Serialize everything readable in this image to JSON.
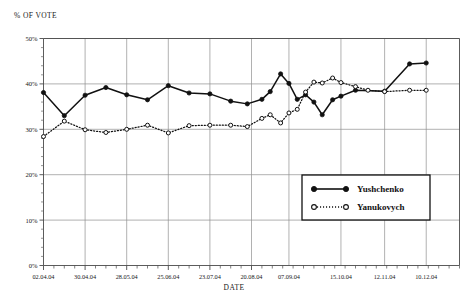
{
  "chart_data": {
    "type": "line",
    "title": "",
    "ylabel": "% OF VOTE",
    "xlabel": "DATE",
    "ylim": [
      0,
      50
    ],
    "ytick_labels": [
      "0%",
      "10%",
      "20%",
      "30%",
      "40%",
      "50%"
    ],
    "ytick_values": [
      0,
      10,
      20,
      30,
      40,
      50
    ],
    "yminor_step": 2,
    "grid": true,
    "legend_position": "inside-right",
    "xtick_labels": [
      "02.04.04",
      "30.04.04",
      "28.05.04",
      "25.06.04",
      "23.07.04",
      "20.08.04",
      "07.09.04",
      "15.10.04",
      "12.11.04",
      "10.12.04"
    ],
    "xtick_positions": [
      0,
      4,
      8,
      12,
      16,
      20,
      23.6,
      28.6,
      32.8,
      36.8
    ],
    "x_minor_count": 40,
    "series": [
      {
        "name": "Yushchenko",
        "marker": "filled-circle",
        "line": "solid",
        "color": "#111111",
        "points": [
          [
            0,
            38.1
          ],
          [
            2.0,
            33.0
          ],
          [
            4.0,
            37.5
          ],
          [
            6.0,
            39.2
          ],
          [
            8.0,
            37.6
          ],
          [
            10.0,
            36.5
          ],
          [
            12.0,
            39.6
          ],
          [
            14.0,
            38.0
          ],
          [
            16.0,
            37.8
          ],
          [
            18.0,
            36.2
          ],
          [
            19.6,
            35.6
          ],
          [
            21.0,
            36.6
          ],
          [
            21.8,
            38.3
          ],
          [
            22.8,
            42.2
          ],
          [
            23.6,
            40.1
          ],
          [
            24.4,
            36.6
          ],
          [
            25.2,
            37.6
          ],
          [
            26.0,
            36.0
          ],
          [
            26.8,
            33.2
          ],
          [
            27.8,
            36.5
          ],
          [
            28.6,
            37.3
          ],
          [
            30.0,
            38.6
          ],
          [
            32.8,
            38.4
          ],
          [
            35.2,
            44.4
          ],
          [
            36.8,
            44.6
          ]
        ]
      },
      {
        "name": "Yanukovych",
        "marker": "open-circle",
        "line": "dotted",
        "color": "#111111",
        "points": [
          [
            0,
            28.4
          ],
          [
            2.0,
            31.8
          ],
          [
            4.0,
            29.9
          ],
          [
            6.0,
            29.3
          ],
          [
            8.0,
            30.0
          ],
          [
            10.0,
            30.9
          ],
          [
            12.0,
            29.2
          ],
          [
            14.0,
            30.8
          ],
          [
            16.0,
            30.9
          ],
          [
            18.0,
            30.9
          ],
          [
            19.6,
            30.6
          ],
          [
            21.0,
            32.4
          ],
          [
            21.8,
            33.2
          ],
          [
            22.8,
            31.4
          ],
          [
            23.6,
            33.6
          ],
          [
            24.4,
            34.4
          ],
          [
            25.2,
            38.2
          ],
          [
            26.0,
            40.4
          ],
          [
            26.8,
            40.2
          ],
          [
            27.8,
            41.3
          ],
          [
            28.6,
            40.3
          ],
          [
            30.0,
            39.4
          ],
          [
            31.2,
            38.6
          ],
          [
            32.8,
            38.3
          ],
          [
            35.2,
            38.6
          ],
          [
            36.8,
            38.6
          ]
        ]
      }
    ]
  },
  "legend": {
    "items": [
      {
        "label": "Yushchenko"
      },
      {
        "label": "Yanukovych"
      }
    ]
  }
}
